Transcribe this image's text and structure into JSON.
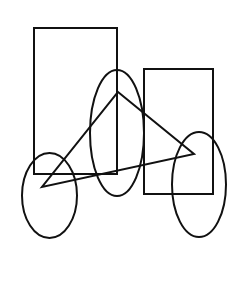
{
  "diagram": {
    "width": 241,
    "height": 282,
    "background": "#ffffff",
    "stroke_color": "#111111",
    "stroke_width": 2,
    "shapes": {
      "rect_left": {
        "type": "rectangle",
        "x": 34,
        "y": 28,
        "width": 83,
        "height": 146
      },
      "rect_right": {
        "type": "rectangle",
        "x": 144,
        "y": 69,
        "width": 69,
        "height": 125
      },
      "ellipse_middle": {
        "type": "ellipse",
        "cx": 117,
        "cy": 133,
        "rx": 27,
        "ry": 63
      },
      "ellipse_left": {
        "type": "ellipse",
        "cx": 49.5,
        "cy": 195.5,
        "rx": 27.5,
        "ry": 42.5
      },
      "ellipse_right": {
        "type": "ellipse",
        "cx": 199,
        "cy": 184.5,
        "rx": 27,
        "ry": 52.5
      },
      "triangle": {
        "type": "triangle",
        "points": "118,92 194,154 42,187"
      }
    }
  }
}
